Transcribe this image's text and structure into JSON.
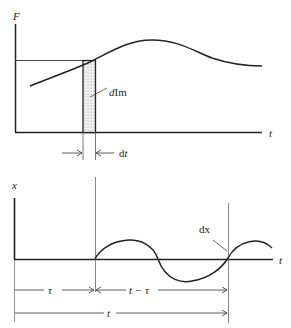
{
  "top_panel": {
    "y_axis_label": "F",
    "x_axis_label": "t",
    "element_label_d": "d",
    "element_label_rest": "Im",
    "width_label_d": "d",
    "width_label_t": "t"
  },
  "bottom_panel": {
    "y_axis_label": "x",
    "x_axis_label": "t",
    "response_label": "dx",
    "interval_tau": "τ",
    "interval_t_minus_tau": "t − τ",
    "interval_t": "t"
  },
  "colors": {
    "line": "#222222",
    "thin_line": "#555555",
    "hatch_fill": "#e4e4e4"
  }
}
